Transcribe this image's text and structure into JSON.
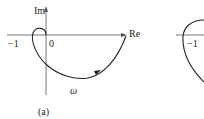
{
  "figure_a": {
    "axis_imag_label": "Im",
    "axis_real_label": "Re",
    "tick_minus_one": "−1",
    "origin": "0",
    "omega": "ω",
    "caption": "(a)"
  },
  "figure_b": {
    "tick_minus_one": "−1"
  }
}
